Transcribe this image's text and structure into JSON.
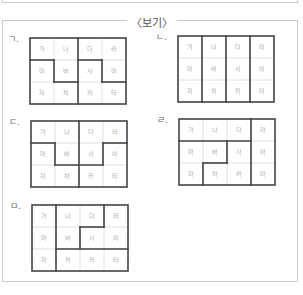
{
  "title": "〈보기〉",
  "cells": [
    "가",
    "나",
    "다",
    "라",
    "마",
    "바",
    "사",
    "아",
    "자",
    "차",
    "카",
    "타"
  ],
  "grids": [
    {
      "label": "ㄱ.",
      "x": 30,
      "y": 38,
      "segments": [
        [
          0,
          1,
          1,
          1
        ],
        [
          1,
          1,
          1,
          2
        ],
        [
          1,
          2,
          2,
          2
        ],
        [
          2,
          0,
          2,
          3
        ],
        [
          2,
          1,
          3,
          1
        ],
        [
          3,
          1,
          3,
          2
        ],
        [
          3,
          2,
          4,
          2
        ]
      ]
    },
    {
      "label": "ㄴ.",
      "x": 178,
      "y": 36,
      "segments": [
        [
          1,
          0,
          1,
          3
        ],
        [
          2,
          0,
          2,
          3
        ],
        [
          3,
          0,
          3,
          3
        ]
      ]
    },
    {
      "label": "ㄷ.",
      "x": 31,
      "y": 121,
      "segments": [
        [
          0,
          1,
          1,
          1
        ],
        [
          1,
          1,
          1,
          2
        ],
        [
          1,
          2,
          3,
          2
        ],
        [
          2,
          0,
          2,
          3
        ],
        [
          3,
          1,
          4,
          1
        ],
        [
          3,
          1,
          3,
          2
        ]
      ]
    },
    {
      "label": "ㄹ.",
      "x": 179,
      "y": 119,
      "segments": [
        [
          3,
          0,
          3,
          3
        ],
        [
          0,
          1,
          3,
          1
        ],
        [
          2,
          1,
          2,
          2
        ],
        [
          1,
          2,
          2,
          2
        ],
        [
          1,
          2,
          1,
          3
        ]
      ]
    },
    {
      "label": "ㅁ.",
      "x": 32,
      "y": 205,
      "segments": [
        [
          1,
          0,
          1,
          3
        ],
        [
          3,
          0,
          3,
          1
        ],
        [
          2,
          1,
          3,
          1
        ],
        [
          2,
          1,
          2,
          2
        ],
        [
          1,
          2,
          4,
          2
        ]
      ]
    }
  ],
  "colors": {
    "thick": "#444444",
    "thin": "#d8d8d8",
    "box": "#c8c8c8",
    "cell_text": "#aaaaaa"
  }
}
